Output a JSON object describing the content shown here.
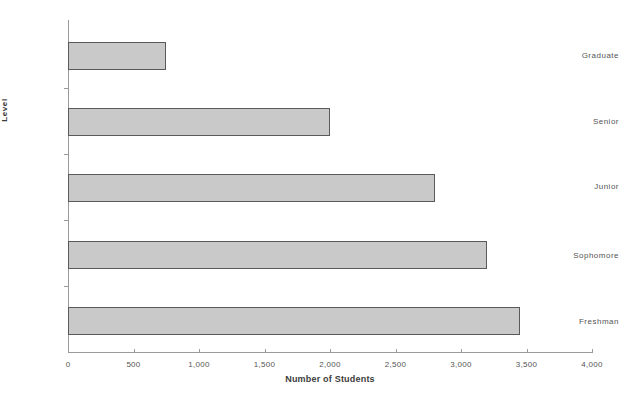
{
  "chart_data": {
    "type": "bar",
    "orientation": "horizontal",
    "title": "",
    "xlabel": "Number of Students",
    "ylabel": "Level",
    "categories": [
      "Freshman",
      "Sophomore",
      "Junior",
      "Senior",
      "Graduate"
    ],
    "values": [
      3450,
      3200,
      2800,
      2000,
      750
    ],
    "xlim": [
      0,
      4000
    ],
    "xticks": [
      0,
      500,
      1000,
      1500,
      2000,
      2500,
      3000,
      3500,
      4000
    ],
    "xtick_labels": [
      "0",
      "500",
      "1,000",
      "1,500",
      "2,000",
      "2,500",
      "3,000",
      "3,500",
      "4,000"
    ],
    "grid": false,
    "legend": null,
    "bar_fill_color": "#c9c9c9",
    "bar_border_color": "#5a5a5a",
    "axis_color": "#9a9a9a",
    "background_color": "#ffffff",
    "text_color": "#555555"
  }
}
